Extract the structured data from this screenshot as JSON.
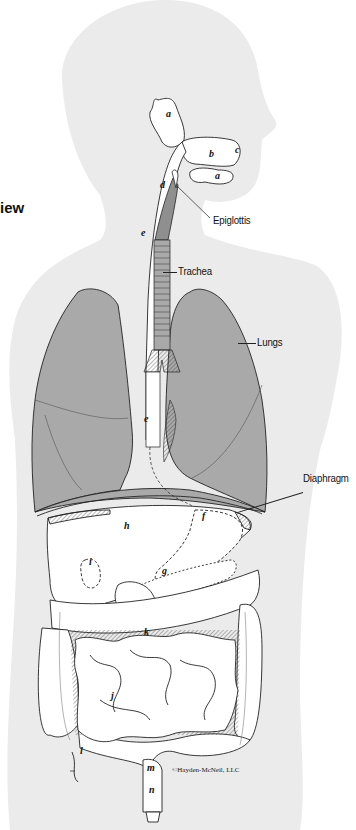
{
  "figure": {
    "heading_fragment": "iew",
    "copyright": "©Hayden-McNeil, LLC",
    "colors": {
      "background": "#ffffff",
      "silhouette": "#ebebeb",
      "organ_fill": "#ffffff",
      "lung_fill": "#a9a9a9",
      "larynx_fill": "#8f8f8f",
      "outline": "#222222"
    },
    "callouts": [
      {
        "id": "epiglottis",
        "text": "Epiglottis"
      },
      {
        "id": "trachea",
        "text": "Trachea"
      },
      {
        "id": "lungs",
        "text": "Lungs"
      },
      {
        "id": "diaphragm",
        "text": "Diaphragm"
      }
    ],
    "letters": {
      "a_parotid": "a",
      "a_sublingual": "a",
      "b": "b",
      "c": "c",
      "d": "d",
      "e_upper": "e",
      "e_lower": "e",
      "f": "f",
      "g": "g",
      "h": "h",
      "i": "i",
      "j": "j",
      "k": "k",
      "l": "l",
      "m": "m",
      "n": "n"
    }
  }
}
